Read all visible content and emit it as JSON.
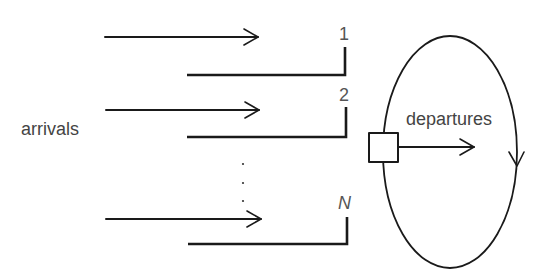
{
  "diagram": {
    "type": "multi-queue polling system",
    "labels": {
      "arrivals": "arrivals",
      "departures": "departures"
    },
    "queues": [
      {
        "label": "1",
        "italic": false
      },
      {
        "label": "2",
        "italic": false
      },
      {
        "label": "N",
        "italic": true
      }
    ],
    "ellipsis": "⋮",
    "colors": {
      "stroke": "#1a1a1a",
      "text": "#444444",
      "background": "#ffffff"
    }
  }
}
